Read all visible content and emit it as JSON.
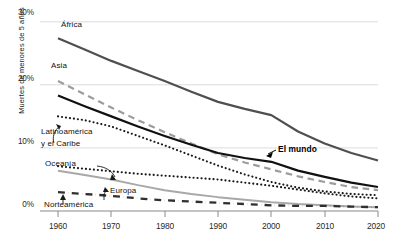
{
  "chart_data": {
    "type": "line",
    "title": "",
    "xlabel": "",
    "ylabel": "Muertes de menores de 5 años",
    "xlim": [
      1960,
      2020
    ],
    "ylim": [
      0,
      30
    ],
    "grid": true,
    "legend_position": "inline-labels",
    "x_ticks": [
      "1960",
      "1970",
      "1980",
      "1990",
      "2000",
      "2010",
      "2020"
    ],
    "y_ticks": [
      "0%",
      "10%",
      "20%",
      "30%"
    ],
    "x": [
      1960,
      1965,
      1970,
      1975,
      1980,
      1985,
      1990,
      1995,
      2000,
      2005,
      2010,
      2015,
      2020
    ],
    "series": [
      {
        "name": "África",
        "label": "África",
        "style": "solid",
        "color": "#4f4f4f",
        "width": 2.2,
        "values": [
          27.4,
          25.6,
          23.8,
          22.2,
          20.6,
          18.9,
          17.3,
          16.2,
          15.2,
          12.6,
          10.7,
          9.2,
          8.0
        ]
      },
      {
        "name": "Asia",
        "label": "Asia",
        "style": "dashed",
        "color": "#9c9c9c",
        "width": 2.2,
        "values": [
          20.6,
          18.5,
          16.4,
          14.4,
          12.5,
          10.7,
          9.0,
          7.7,
          6.6,
          5.5,
          4.6,
          3.8,
          3.3
        ]
      },
      {
        "name": "El mundo",
        "label": "El mundo",
        "style": "solid",
        "color": "#111111",
        "width": 2.2,
        "values": [
          18.3,
          16.6,
          15.0,
          13.4,
          11.9,
          10.5,
          9.2,
          8.4,
          7.8,
          6.4,
          5.4,
          4.5,
          3.8
        ]
      },
      {
        "name": "Latinoamérica y el Caribe",
        "label": "Latinoamérica y el Caribe",
        "style": "dotted",
        "color": "#1a1a1a",
        "width": 2.1,
        "values": [
          15.0,
          14.4,
          13.4,
          11.9,
          10.4,
          8.8,
          7.2,
          5.8,
          4.6,
          3.7,
          3.1,
          2.7,
          2.5
        ]
      },
      {
        "name": "Oceanía",
        "label": "Oceanía",
        "style": "dotted",
        "color": "#1a1a1a",
        "width": 2.1,
        "values": [
          7.1,
          6.7,
          6.3,
          5.9,
          5.6,
          5.3,
          5.0,
          4.5,
          4.0,
          3.4,
          2.8,
          2.3,
          2.0
        ]
      },
      {
        "name": "Europa",
        "label": "Europa",
        "style": "solid",
        "color": "#a8a8a8",
        "width": 2.0,
        "values": [
          6.4,
          5.7,
          5.0,
          4.1,
          3.3,
          2.7,
          2.2,
          1.8,
          1.4,
          1.1,
          0.9,
          0.7,
          0.6
        ]
      },
      {
        "name": "Norteamérica",
        "label": "Norteamérica",
        "style": "dashdot",
        "color": "#2f2f2f",
        "width": 2.3,
        "values": [
          3.0,
          2.7,
          2.4,
          2.0,
          1.7,
          1.5,
          1.3,
          1.1,
          0.9,
          0.8,
          0.8,
          0.7,
          0.6
        ]
      }
    ],
    "annotations": [
      {
        "text": "África",
        "target": "África"
      },
      {
        "text": "Asia",
        "target": "Asia"
      },
      {
        "text": "El mundo",
        "target": "El mundo"
      },
      {
        "text": "Latinoamérica",
        "target": "Latinoamérica y el Caribe"
      },
      {
        "text": "y el Caribe",
        "target": "Latinoamérica y el Caribe"
      },
      {
        "text": "Oceanía",
        "target": "Oceanía"
      },
      {
        "text": "Europa",
        "target": "Europa"
      },
      {
        "text": "Norteamérica",
        "target": "Norteamérica"
      }
    ]
  },
  "axis": {
    "ylabel": "Muertes de menores de 5 años",
    "yticks": {
      "t0": "0%",
      "t10": "10%",
      "t20": "20%",
      "t30": "30%"
    },
    "xticks": {
      "x1960": "1960",
      "x1970": "1970",
      "x1980": "1980",
      "x1990": "1990",
      "x2000": "2000",
      "x2010": "2010",
      "x2020": "2020"
    }
  },
  "labels": {
    "africa": "África",
    "asia": "Asia",
    "mundo": "El mundo",
    "latam_l1": "Latinoamérica",
    "latam_l2": "y el Caribe",
    "oceania": "Oceanía",
    "europa": "Europa",
    "norteamerica": "Norteamérica"
  },
  "colors": {
    "africa": "#4f4f4f",
    "asia": "#9c9c9c",
    "mundo": "#111111",
    "latam": "#1a1a1a",
    "oceania": "#1a1a1a",
    "europa": "#a8a8a8",
    "norteamerica": "#2f2f2f",
    "grid": "#dcdcdc",
    "axis": "#8a8a8a"
  }
}
